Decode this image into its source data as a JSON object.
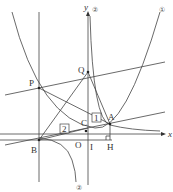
{
  "figure": {
    "type": "coordinate-geometry-diagram",
    "axes": {
      "x_label": "x",
      "y_label": "y"
    },
    "points": {
      "P": "P",
      "Q": "Q",
      "A": "A",
      "B": "B",
      "C": "C",
      "O": "O",
      "I": "I",
      "H": "H"
    },
    "curve_labels": {
      "parabola": "①",
      "hyperbola": "②"
    },
    "boxed_labels": {
      "box1": "1",
      "box2": "2"
    }
  }
}
